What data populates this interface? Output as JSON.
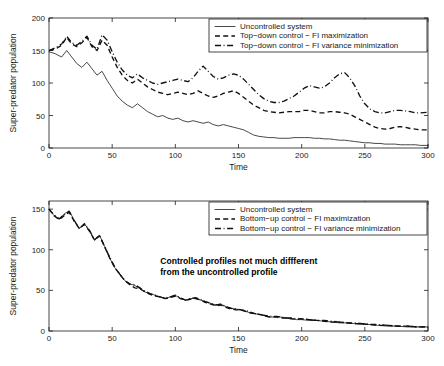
{
  "chart_data": [
    {
      "panel": "top",
      "type": "line",
      "title": "",
      "xlabel": "Time",
      "ylabel": "Super-predator population",
      "xlim": [
        0,
        300
      ],
      "ylim": [
        0,
        200
      ],
      "xticks": [
        0,
        50,
        100,
        150,
        200,
        250,
        300
      ],
      "yticks": [
        0,
        50,
        100,
        150,
        200
      ],
      "grid": false,
      "legend_position": "upper-right",
      "series": [
        {
          "name": "Uncontrolled system",
          "style": "solid",
          "x": [
            0,
            5,
            10,
            14,
            18,
            22,
            26,
            30,
            34,
            38,
            42,
            46,
            50,
            54,
            58,
            62,
            66,
            70,
            74,
            78,
            82,
            86,
            90,
            94,
            98,
            102,
            106,
            110,
            114,
            118,
            122,
            126,
            130,
            134,
            138,
            142,
            146,
            150,
            154,
            158,
            162,
            166,
            170,
            174,
            178,
            182,
            186,
            190,
            194,
            198,
            202,
            206,
            210,
            214,
            218,
            222,
            226,
            230,
            234,
            238,
            242,
            246,
            250,
            254,
            258,
            262,
            266,
            270,
            274,
            278,
            282,
            286,
            290,
            294,
            300
          ],
          "y": [
            148,
            145,
            140,
            150,
            140,
            130,
            124,
            132,
            122,
            112,
            118,
            104,
            92,
            80,
            72,
            66,
            62,
            68,
            62,
            56,
            52,
            48,
            50,
            46,
            44,
            46,
            42,
            40,
            42,
            40,
            38,
            40,
            36,
            34,
            36,
            34,
            32,
            30,
            28,
            24,
            20,
            18,
            17,
            16,
            16,
            15,
            15,
            15,
            16,
            16,
            16,
            16,
            15,
            15,
            14,
            14,
            13,
            12,
            12,
            11,
            10,
            9,
            8,
            8,
            7,
            7,
            6,
            6,
            6,
            5,
            5,
            5,
            5,
            4,
            4
          ]
        },
        {
          "name": "Top-down control - FI maximization",
          "style": "dashed",
          "x": [
            0,
            5,
            10,
            14,
            18,
            22,
            26,
            30,
            34,
            38,
            42,
            46,
            50,
            54,
            58,
            62,
            66,
            70,
            74,
            78,
            82,
            86,
            90,
            94,
            98,
            102,
            106,
            110,
            114,
            118,
            122,
            126,
            130,
            134,
            138,
            142,
            146,
            150,
            154,
            158,
            162,
            166,
            170,
            174,
            178,
            182,
            186,
            190,
            194,
            198,
            202,
            206,
            210,
            214,
            218,
            222,
            226,
            230,
            234,
            238,
            242,
            246,
            250,
            254,
            258,
            262,
            266,
            270,
            274,
            278,
            282,
            286,
            290,
            294,
            300
          ],
          "y": [
            150,
            152,
            158,
            170,
            160,
            156,
            162,
            170,
            156,
            150,
            166,
            158,
            140,
            124,
            112,
            104,
            100,
            106,
            100,
            94,
            90,
            86,
            84,
            82,
            84,
            86,
            84,
            82,
            84,
            88,
            84,
            80,
            78,
            80,
            84,
            86,
            88,
            84,
            78,
            72,
            66,
            62,
            58,
            56,
            55,
            54,
            55,
            56,
            56,
            56,
            58,
            58,
            56,
            54,
            54,
            56,
            56,
            55,
            54,
            52,
            48,
            44,
            40,
            36,
            32,
            30,
            29,
            30,
            32,
            33,
            32,
            30,
            29,
            28,
            28
          ]
        },
        {
          "name": "Top-down control - FI variance minimization",
          "style": "dashdot",
          "x": [
            0,
            5,
            10,
            14,
            18,
            22,
            26,
            30,
            34,
            38,
            42,
            46,
            50,
            54,
            58,
            62,
            66,
            70,
            74,
            78,
            82,
            86,
            90,
            94,
            98,
            102,
            106,
            110,
            114,
            118,
            122,
            126,
            130,
            134,
            138,
            142,
            146,
            150,
            154,
            158,
            162,
            166,
            170,
            174,
            178,
            182,
            186,
            190,
            194,
            198,
            202,
            206,
            210,
            214,
            218,
            222,
            226,
            230,
            234,
            238,
            242,
            246,
            250,
            254,
            258,
            262,
            266,
            270,
            274,
            278,
            282,
            286,
            290,
            294,
            300
          ],
          "y": [
            150,
            154,
            160,
            172,
            162,
            158,
            164,
            172,
            158,
            152,
            174,
            166,
            148,
            132,
            120,
            112,
            108,
            114,
            108,
            104,
            100,
            98,
            100,
            102,
            104,
            106,
            104,
            102,
            108,
            118,
            126,
            118,
            110,
            106,
            108,
            112,
            114,
            112,
            106,
            98,
            90,
            82,
            76,
            72,
            70,
            70,
            72,
            76,
            80,
            86,
            92,
            96,
            94,
            92,
            94,
            100,
            108,
            114,
            116,
            108,
            96,
            80,
            68,
            60,
            56,
            54,
            54,
            56,
            58,
            58,
            57,
            56,
            54,
            54,
            55
          ]
        }
      ]
    },
    {
      "panel": "bottom",
      "type": "line",
      "title": "",
      "xlabel": "Time",
      "ylabel": "Super-predator population",
      "xlim": [
        0,
        300
      ],
      "ylim": [
        0,
        160
      ],
      "xticks": [
        0,
        50,
        100,
        150,
        200,
        250,
        300
      ],
      "yticks": [
        0,
        50,
        100,
        150
      ],
      "grid": false,
      "legend_position": "upper-right",
      "annotation": {
        "line1": "Controlled profiles not much diffferent",
        "line2": "from the uncontrolled profile"
      },
      "series": [
        {
          "name": "Uncontrolled system",
          "style": "solid",
          "x": [
            0,
            4,
            8,
            12,
            16,
            20,
            24,
            28,
            32,
            36,
            40,
            44,
            48,
            52,
            56,
            60,
            64,
            68,
            72,
            76,
            80,
            84,
            88,
            92,
            96,
            100,
            104,
            108,
            112,
            116,
            120,
            124,
            128,
            132,
            136,
            140,
            144,
            148,
            152,
            156,
            160,
            164,
            168,
            172,
            176,
            180,
            184,
            188,
            192,
            196,
            200,
            206,
            212,
            218,
            224,
            230,
            236,
            242,
            248,
            254,
            260,
            268,
            276,
            284,
            292,
            300
          ],
          "y": [
            150,
            142,
            138,
            144,
            148,
            136,
            126,
            132,
            124,
            112,
            118,
            104,
            90,
            78,
            70,
            62,
            58,
            56,
            52,
            48,
            46,
            44,
            42,
            40,
            42,
            44,
            40,
            38,
            40,
            40,
            38,
            36,
            34,
            32,
            33,
            30,
            28,
            27,
            26,
            24,
            22,
            21,
            20,
            18,
            17,
            18,
            17,
            16,
            15,
            14,
            14,
            13,
            13,
            12,
            11,
            10,
            10,
            9,
            8,
            8,
            7,
            6,
            6,
            5,
            5,
            5
          ]
        },
        {
          "name": "Bottom-up control - FI maximization",
          "style": "dashed",
          "x": [
            0,
            4,
            8,
            12,
            16,
            20,
            24,
            28,
            32,
            36,
            40,
            44,
            48,
            52,
            56,
            60,
            64,
            68,
            72,
            76,
            80,
            84,
            88,
            92,
            96,
            100,
            104,
            108,
            112,
            116,
            120,
            124,
            128,
            132,
            136,
            140,
            144,
            148,
            152,
            156,
            160,
            164,
            168,
            172,
            176,
            180,
            184,
            188,
            192,
            196,
            200,
            206,
            212,
            218,
            224,
            230,
            236,
            242,
            248,
            254,
            260,
            268,
            276,
            284,
            292,
            300
          ],
          "y": [
            150,
            142,
            137,
            142,
            146,
            135,
            126,
            131,
            123,
            112,
            117,
            104,
            90,
            78,
            70,
            62,
            57,
            53,
            52,
            48,
            45,
            43,
            42,
            40,
            41,
            43,
            40,
            38,
            39,
            40,
            38,
            35,
            33,
            31,
            32,
            29,
            27,
            26,
            26,
            24,
            22,
            21,
            20,
            18,
            17,
            17,
            16,
            16,
            15,
            15,
            15,
            14,
            13,
            12,
            11,
            11,
            10,
            9,
            9,
            8,
            7,
            7,
            6,
            6,
            5,
            5
          ]
        },
        {
          "name": "Bottom-up control - FI variance minimization",
          "style": "dashdot",
          "x": [
            0,
            4,
            8,
            12,
            16,
            20,
            24,
            28,
            32,
            36,
            40,
            44,
            48,
            52,
            56,
            60,
            64,
            68,
            72,
            76,
            80,
            84,
            88,
            92,
            96,
            100,
            104,
            108,
            112,
            116,
            120,
            124,
            128,
            132,
            136,
            140,
            144,
            148,
            152,
            156,
            160,
            164,
            168,
            172,
            176,
            180,
            184,
            188,
            192,
            196,
            200,
            206,
            212,
            218,
            224,
            230,
            236,
            242,
            248,
            254,
            260,
            268,
            276,
            284,
            292,
            300
          ],
          "y": [
            150,
            143,
            138,
            143,
            147,
            136,
            126,
            132,
            124,
            112,
            118,
            104,
            91,
            79,
            70,
            62,
            58,
            57,
            53,
            49,
            46,
            44,
            42,
            40,
            42,
            44,
            41,
            38,
            40,
            41,
            39,
            36,
            34,
            32,
            33,
            30,
            28,
            27,
            26,
            25,
            23,
            21,
            20,
            19,
            18,
            18,
            17,
            16,
            16,
            15,
            15,
            14,
            13,
            13,
            12,
            11,
            10,
            10,
            9,
            8,
            8,
            7,
            6,
            6,
            5,
            5
          ]
        }
      ]
    }
  ]
}
